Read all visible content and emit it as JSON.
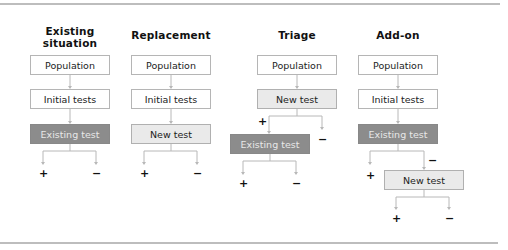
{
  "columns": [
    {
      "title": "Existing situation",
      "boxes": [
        {
          "label": "Population",
          "style": "white"
        },
        {
          "label": "Initial tests",
          "style": "white"
        },
        {
          "label": "Existing test",
          "style": "dark"
        }
      ],
      "outcomes": {
        "positive": "+",
        "negative": "−"
      }
    },
    {
      "title": "Replacement",
      "boxes": [
        {
          "label": "Population",
          "style": "white"
        },
        {
          "label": "Initial tests",
          "style": "white"
        },
        {
          "label": "New test",
          "style": "light"
        }
      ],
      "outcomes": {
        "positive": "+",
        "negative": "−"
      }
    },
    {
      "title": "Triage",
      "boxes": [
        {
          "label": "Population",
          "style": "white"
        },
        {
          "label": "New test",
          "style": "light"
        },
        {
          "label": "Existing test",
          "style": "dark"
        }
      ],
      "branch_labels": {
        "positive": "+",
        "negative": "−"
      },
      "outcomes": {
        "positive": "+",
        "negative": "−"
      }
    },
    {
      "title": "Add-on",
      "boxes": [
        {
          "label": "Population",
          "style": "white"
        },
        {
          "label": "Initial tests",
          "style": "white"
        },
        {
          "label": "Existing test",
          "style": "dark"
        },
        {
          "label": "New test",
          "style": "light"
        }
      ],
      "branch_labels": {
        "positive": "+",
        "negative": "−"
      },
      "outcomes": {
        "positive": "+",
        "negative": "−"
      }
    }
  ],
  "colors": {
    "dark_box": "#8c8c8c",
    "light_box": "#eaeaea",
    "white_box": "#ffffff",
    "connector": "#b8b8b8"
  }
}
